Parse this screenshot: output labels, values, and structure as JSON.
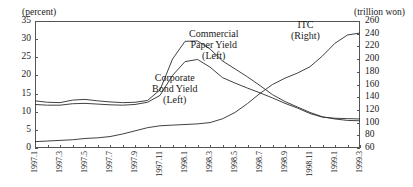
{
  "axes": {
    "left_unit": "(percent)",
    "right_unit": "(trillion won)",
    "left_ticks": [
      "35",
      "30",
      "25",
      "20",
      "15",
      "10",
      "5",
      "0"
    ],
    "right_ticks": [
      "260",
      "240",
      "220",
      "200",
      "180",
      "160",
      "140",
      "120",
      "100",
      "80",
      "60"
    ],
    "x_ticks": [
      "1997.1",
      "1997.3",
      "1997.5",
      "1997.7",
      "1997.9",
      "1997.11",
      "1998.1",
      "1998.3",
      "1998.5",
      "1998.7",
      "1998.9",
      "1998.11",
      "1999.1",
      "1999.3"
    ]
  },
  "annotations": {
    "commercial_paper": "Commercial\nPaper Yield\n(Left)",
    "cp_l1": "Commercial",
    "cp_l2": "Paper Yield",
    "cp_l3": "(Left)",
    "cb_l1": "Corporate",
    "cb_l2": "Bond Yield",
    "cb_l3": "(Left)",
    "itc_l1": "ITC",
    "itc_l2": "(Right)"
  },
  "chart_data": {
    "type": "line",
    "title": "",
    "xlabel": "",
    "ylabel": "(percent)",
    "y2label": "(trillion won)",
    "ylim": [
      0,
      35
    ],
    "y2lim": [
      60,
      260
    ],
    "grid": false,
    "legend": "inline-annotations",
    "x": [
      "1997.1",
      "1997.2",
      "1997.3",
      "1997.4",
      "1997.5",
      "1997.6",
      "1997.7",
      "1997.8",
      "1997.9",
      "1997.10",
      "1997.11",
      "1997.12",
      "1998.1",
      "1998.2",
      "1998.3",
      "1998.4",
      "1998.5",
      "1998.6",
      "1998.7",
      "1998.8",
      "1998.9",
      "1998.10",
      "1998.11",
      "1998.12",
      "1999.1",
      "1999.2",
      "1999.3"
    ],
    "series": [
      {
        "name": "Commercial Paper Yield (Left)",
        "axis": "left",
        "unit": "percent",
        "values": [
          13.0,
          12.6,
          12.5,
          13.2,
          13.4,
          13.0,
          12.7,
          12.5,
          12.6,
          13.1,
          16.0,
          24.5,
          29.4,
          29.5,
          27.3,
          24.0,
          21.8,
          19.6,
          17.2,
          14.7,
          12.8,
          11.3,
          9.8,
          8.6,
          8.0,
          7.6,
          7.5
        ]
      },
      {
        "name": "Corporate Bond Yield (Left)",
        "axis": "left",
        "unit": "percent",
        "values": [
          12.0,
          11.8,
          11.8,
          12.2,
          12.3,
          12.1,
          11.9,
          11.8,
          12.0,
          12.6,
          14.5,
          20.0,
          23.8,
          24.4,
          22.3,
          19.4,
          17.9,
          16.5,
          15.2,
          13.8,
          12.3,
          11.0,
          9.5,
          8.5,
          8.2,
          8.1,
          8.0
        ]
      },
      {
        "name": "ITC (Right)",
        "axis": "right",
        "unit": "trillion won",
        "values": [
          70,
          71,
          72,
          73,
          75,
          76,
          78,
          82,
          87,
          92,
          95,
          96,
          97,
          98,
          100,
          106,
          116,
          130,
          146,
          160,
          170,
          178,
          188,
          205,
          225,
          238,
          241
        ]
      }
    ]
  }
}
